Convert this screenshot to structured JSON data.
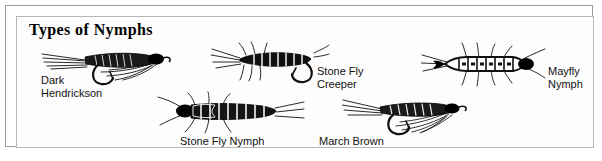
{
  "panel": {
    "title": "Types of Nymphs",
    "frame_color": "#9a9a9a",
    "inner_frame_color": "#b7b7b7",
    "background_color": "#ffffff",
    "ink_color": "#000000"
  },
  "specimens": [
    {
      "id": "dark-hendrickson",
      "label": "Dark\nHendrickson",
      "type": "wet-fly",
      "label_position": "below-left"
    },
    {
      "id": "stone-fly-creeper",
      "label": "Stone Fly\nCreeper",
      "type": "nymph",
      "label_position": "right"
    },
    {
      "id": "mayfly-nymph",
      "label": "Mayfly\nNymph",
      "type": "nymph",
      "label_position": "right"
    },
    {
      "id": "stone-fly-nymph",
      "label": "Stone Fly Nymph",
      "type": "nymph",
      "label_position": "below"
    },
    {
      "id": "march-brown",
      "label": "March Brown",
      "type": "wet-fly",
      "label_position": "below-left"
    }
  ]
}
